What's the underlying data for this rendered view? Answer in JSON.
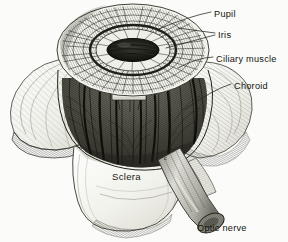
{
  "figure": {
    "kind": "anatomical-illustration",
    "background_color": "#fbfbfa",
    "ink_color": "#23231c",
    "labels": [
      {
        "id": "pupil",
        "text": "Pupil",
        "x": 214,
        "y": 14
      },
      {
        "id": "iris",
        "text": "Iris",
        "x": 218,
        "y": 35
      },
      {
        "id": "ciliary-muscle",
        "text": "Ciliary muscle",
        "x": 216,
        "y": 59
      },
      {
        "id": "choroid",
        "text": "Choroid",
        "x": 234,
        "y": 86
      },
      {
        "id": "sclera",
        "text": "Sclera",
        "x": 112,
        "y": 177
      },
      {
        "id": "optic-nerve",
        "text": "Optic nerve",
        "x": 197,
        "y": 228
      }
    ],
    "markers": [
      {
        "id": "c-left",
        "text": "c",
        "x": 106,
        "y": 159
      },
      {
        "id": "c-right",
        "text": "c",
        "x": 164,
        "y": 158
      }
    ],
    "ghost_text": ""
  }
}
